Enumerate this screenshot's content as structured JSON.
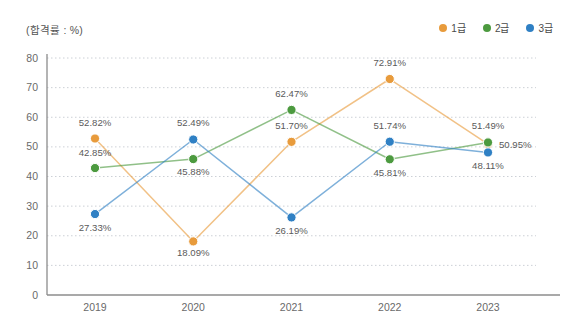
{
  "unit_label": "(합격률 : %)",
  "legend": {
    "position": "top-right",
    "items": [
      {
        "label": "1급",
        "color": "#E89B3C"
      },
      {
        "label": "2급",
        "color": "#4C9A3F"
      },
      {
        "label": "3급",
        "color": "#2F80C4"
      }
    ]
  },
  "chart_data": {
    "type": "line",
    "title": "",
    "subtitle": "",
    "xlabel": "",
    "ylabel": "(합격률 : %)",
    "categories": [
      "2019",
      "2020",
      "2021",
      "2022",
      "2023"
    ],
    "ylim": [
      0,
      80
    ],
    "yticks": [
      0,
      10,
      20,
      30,
      40,
      50,
      60,
      70,
      80
    ],
    "ytick_labels": [
      "0",
      "10",
      "20",
      "30",
      "40",
      "50",
      "60",
      "70",
      "80"
    ],
    "grid": true,
    "grid_axis": "y",
    "grid_style": "dotted",
    "legend_position": "top-right",
    "series": [
      {
        "name": "1급",
        "color": "#E89B3C",
        "values": [
          52.82,
          18.09,
          51.7,
          72.91,
          50.95
        ],
        "labels": [
          "52.82%",
          "18.09%",
          "51.70%",
          "72.91%",
          "50.95%"
        ]
      },
      {
        "name": "2급",
        "color": "#4C9A3F",
        "values": [
          42.85,
          45.88,
          62.47,
          45.81,
          51.49
        ],
        "labels": [
          "42.85%",
          "45.88%",
          "62.47%",
          "45.81%",
          "51.49%"
        ]
      },
      {
        "name": "3급",
        "color": "#2F80C4",
        "values": [
          27.33,
          52.49,
          26.19,
          51.74,
          48.11
        ],
        "labels": [
          "27.33%",
          "52.49%",
          "26.19%",
          "51.74%",
          "48.11%"
        ]
      }
    ]
  }
}
